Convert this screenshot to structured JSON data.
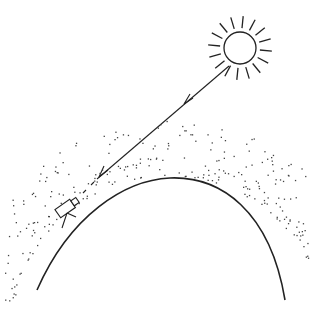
{
  "diagram": {
    "top_fragment_text": "",
    "colors": {
      "background": "#ffffff",
      "ink": "#222222",
      "particles": "#444444"
    },
    "elements": [
      {
        "name": "sun",
        "shape": "circle with radiating rays",
        "center": [
          240,
          48
        ],
        "radius": 16,
        "ray_count": 16
      },
      {
        "name": "light-ray",
        "shape": "line with two arrowheads",
        "from": [
          230,
          66
        ],
        "to": [
          92,
          184
        ]
      },
      {
        "name": "earth-surface",
        "shape": "arc",
        "from": [
          37,
          290
        ],
        "apex": [
          170,
          178
        ],
        "to": [
          285,
          300
        ]
      },
      {
        "name": "atmosphere",
        "shape": "scattered dots",
        "note": "dense near surface, sparse higher up"
      },
      {
        "name": "telescope",
        "shape": "tube on tripod",
        "position": [
          66,
          210
        ]
      }
    ]
  }
}
